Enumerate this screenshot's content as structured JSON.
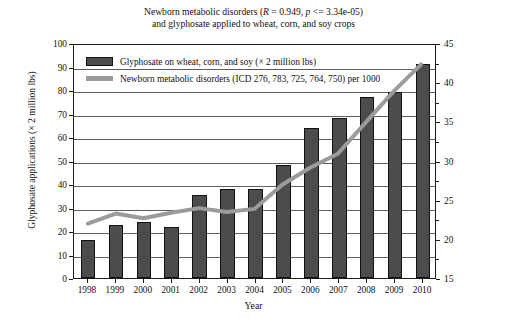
{
  "title": {
    "line1_a": "Newborn metabolic disorders (",
    "line1_R": "R",
    "line1_b": " = 0.949, ",
    "line1_p": "p",
    "line1_c": " <= 3.34e-05)",
    "line2": "and glyphosate applied to wheat, corn, and soy crops"
  },
  "legend": {
    "bar_label": "Glyphosate on wheat, corn, and soy (× 2 million lbs)",
    "line_label": "Newborn metabolic disorders (ICD 276, 783, 725, 764, 750) per 1000"
  },
  "axes": {
    "x_title": "Year",
    "y_left_title": "Glyphosate applications (× 2 million lbs)",
    "y_right_title": "Discharge rate of newborn metabolic disorders per 1000",
    "y_left_ticks": [
      "0",
      "10",
      "20",
      "30",
      "40",
      "50",
      "60",
      "70",
      "80",
      "90",
      "100"
    ],
    "y_right_ticks": [
      "15",
      "20",
      "25",
      "30",
      "35",
      "40",
      "45"
    ]
  },
  "colors": {
    "bar_fill": "#4c4c4c",
    "bar_stroke": "#121212",
    "line": "#9b9b9b",
    "grid": "#5e5e5e",
    "frame": "#1b1b1b",
    "background": "#ffffff"
  },
  "chart_data": {
    "type": "bar",
    "title": "Newborn metabolic disorders (R = 0.949, p <= 3.34e-05) and glyphosate applied to wheat, corn, and soy crops",
    "xlabel": "Year",
    "ylabel": "Glyphosate applications (× 2 million lbs)",
    "y2label": "Discharge rate of newborn metabolic disorders per 1000",
    "categories": [
      "1998",
      "1999",
      "2000",
      "2001",
      "2002",
      "2003",
      "2004",
      "2005",
      "2006",
      "2007",
      "2008",
      "2009",
      "2010"
    ],
    "ylim": [
      0,
      100
    ],
    "y2lim": [
      15,
      45
    ],
    "ytick_step": 10,
    "y2tick_step": 5,
    "grid": true,
    "legend_position": "top-left inside",
    "series": [
      {
        "name": "Glyphosate on wheat, corn, and soy (× 2 million lbs)",
        "type": "bar",
        "axis": "left",
        "values": [
          16,
          22.5,
          24,
          21.5,
          35.5,
          38,
          38,
          48,
          64,
          68,
          77,
          79,
          91
        ]
      },
      {
        "name": "Newborn metabolic disorders (ICD 276, 783, 725, 764, 750) per 1000",
        "type": "line",
        "axis": "right",
        "values": [
          22.0,
          23.3,
          22.7,
          23.4,
          24.0,
          23.5,
          23.9,
          27.0,
          29.2,
          31.0,
          35.0,
          39.0,
          42.5
        ]
      }
    ],
    "annotations": {
      "R": 0.949,
      "p": "<= 3.34e-05"
    }
  }
}
